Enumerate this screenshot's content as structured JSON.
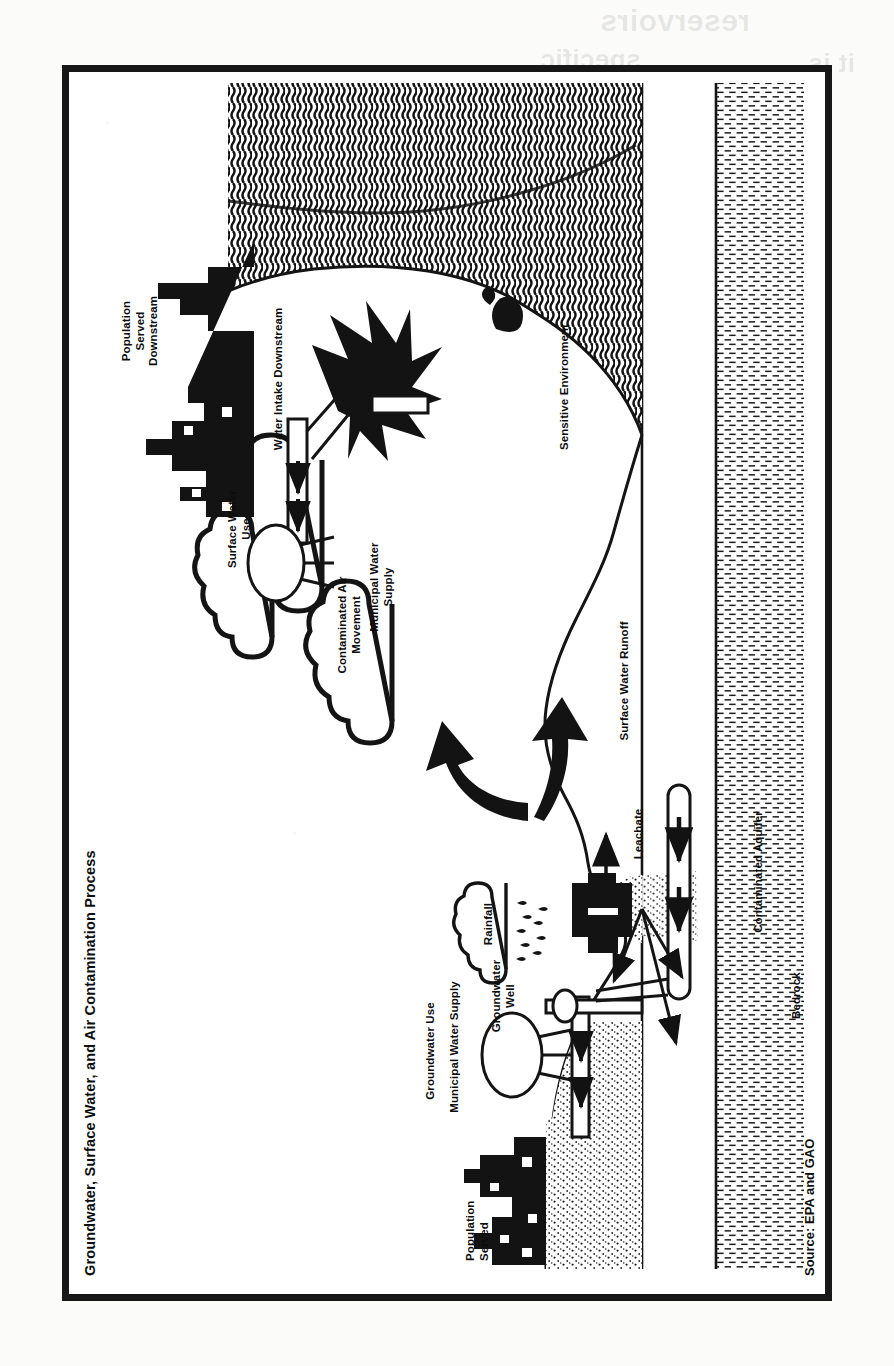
{
  "document": {
    "figure_title": "Groundwater, Surface Water, and Air\nContamination Process",
    "source_note": "Source: EPA and GAO",
    "orientation": "rotated-90-ccw",
    "page_background": "#fbfbfa",
    "ink_color": "#111111"
  },
  "bleed_through": [
    {
      "text": "reservoirs"
    },
    {
      "text": "specific"
    },
    {
      "text": "it is."
    }
  ],
  "diagram": {
    "type": "process-illustration",
    "labels": [
      {
        "id": "population-served",
        "text": "Population\nServed"
      },
      {
        "id": "groundwater-use",
        "text": "Groundwater Use"
      },
      {
        "id": "municipal-water-supply-gw",
        "text": "Municipal Water Supply"
      },
      {
        "id": "groundwater-well",
        "text": "Groundwater\nWell"
      },
      {
        "id": "rainfall",
        "text": "Rainfall"
      },
      {
        "id": "leachate",
        "text": "Leachate"
      },
      {
        "id": "contaminated-aquifer",
        "text": "Contaminated Aquifer"
      },
      {
        "id": "bedrock",
        "text": "Bedrock"
      },
      {
        "id": "surface-water-runoff",
        "text": "Surface Water Runoff"
      },
      {
        "id": "contaminated-air-movement",
        "text": "Contaminated Air\nMovement"
      },
      {
        "id": "sensitive-environment",
        "text": "Sensitive Environment"
      },
      {
        "id": "municipal-water-supply-sw",
        "text": "Municipal Water\nSupply"
      },
      {
        "id": "surface-water-use",
        "text": "Surface Water\nUse"
      },
      {
        "id": "water-intake-downstream",
        "text": "Water Intake Downstream"
      },
      {
        "id": "population-served-downstream",
        "text": "Population\nServed\nDownstream"
      }
    ],
    "elements": [
      "city-skyline-left",
      "water-tower-left",
      "groundwater-well-pipe",
      "landfill-site",
      "rain-cloud",
      "air-clouds",
      "divergent-arrows",
      "aquifer-plume",
      "bedrock-layer",
      "river",
      "lake-water-hatch",
      "water-intake-structure",
      "water-tower-right",
      "city-skyline-right",
      "waterfowl"
    ]
  }
}
